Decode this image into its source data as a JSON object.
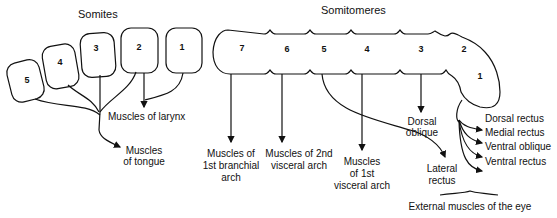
{
  "titles": {
    "somites": "Somites",
    "somitomeres": "Somitomeres"
  },
  "somites": [
    "5",
    "4",
    "3",
    "2",
    "1"
  ],
  "somitomeres": [
    "7",
    "6",
    "5",
    "4",
    "3",
    "2",
    "1"
  ],
  "targets": {
    "larynx": "Muscles of larynx",
    "tongue_1": "Muscles",
    "tongue_2": "of tongue",
    "branchial_1": "Muscles of",
    "branchial_2": "1st branchial",
    "branchial_3": "arch",
    "visceral2_1": "Muscles of 2nd",
    "visceral2_2": "visceral arch",
    "visceral1_1": "Muscles",
    "visceral1_2": "of 1st",
    "visceral1_3": "visceral arch",
    "lateral_1": "Lateral",
    "lateral_2": "rectus",
    "dorsal_oblique_1": "Dorsal",
    "dorsal_oblique_2": "oblique",
    "dorsal_rectus": "Dorsal rectus",
    "medial_rectus": "Medial rectus",
    "ventral_oblique": "Ventral oblique",
    "ventral_rectus": "Ventral rectus",
    "eye_group": "External muscles of the eye"
  }
}
